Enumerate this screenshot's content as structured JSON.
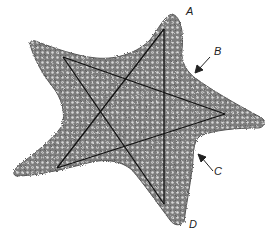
{
  "figure": {
    "labels": [
      {
        "id": "A",
        "text": "A",
        "x": 186,
        "y": 6
      },
      {
        "id": "B",
        "text": "B",
        "x": 214,
        "y": 46
      },
      {
        "id": "C",
        "text": "C",
        "x": 214,
        "y": 166
      },
      {
        "id": "D",
        "text": "D",
        "x": 189,
        "y": 219
      }
    ],
    "arrows": [
      {
        "for": "B",
        "from": [
          210,
          57
        ],
        "to": [
          196,
          72
        ]
      },
      {
        "for": "C",
        "from": [
          213,
          171
        ],
        "to": [
          199,
          155
        ]
      }
    ],
    "pentagram_vertices": {
      "top": [
        164,
        29
      ],
      "upper_left": [
        63,
        57
      ],
      "right": [
        225,
        114
      ],
      "lower_left": [
        57,
        168
      ],
      "bottom": [
        164,
        204
      ]
    },
    "colors": {
      "background": "#ffffff",
      "body": "#8a8a8a",
      "line": "#111111",
      "label": "#222222"
    }
  }
}
